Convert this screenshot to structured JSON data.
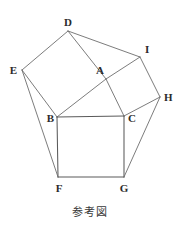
{
  "figure": {
    "caption": "参考図",
    "stroke_color": "#6d6d6d",
    "label_color": "#2b2b2b",
    "background_color": "#ffffff",
    "width": 180,
    "height": 231,
    "points": {
      "A": {
        "label": "A",
        "x": 106,
        "y": 79,
        "label_x": 104,
        "label_y": 74
      },
      "B": {
        "label": "B",
        "x": 57,
        "y": 117,
        "label_x": 49,
        "label_y": 121
      },
      "C": {
        "label": "C",
        "x": 124,
        "y": 116,
        "label_x": 128,
        "label_y": 121
      },
      "D": {
        "label": "D",
        "x": 68,
        "y": 31,
        "label_x": 66,
        "label_y": 26
      },
      "E": {
        "label": "E",
        "x": 22,
        "y": 70,
        "label_x": 13,
        "label_y": 73
      },
      "F": {
        "label": "F",
        "x": 58,
        "y": 177,
        "label_x": 56,
        "label_y": 191
      },
      "G": {
        "label": "G",
        "x": 124,
        "y": 177,
        "label_x": 121,
        "label_y": 191
      },
      "H": {
        "label": "H",
        "x": 160,
        "y": 97,
        "label_x": 164,
        "label_y": 101
      },
      "I": {
        "label": "I",
        "x": 140,
        "y": 57,
        "label_x": 145,
        "label_y": 53
      }
    },
    "segments": [
      {
        "name": "segment-AB",
        "from": "A",
        "to": "B"
      },
      {
        "name": "segment-BC",
        "from": "B",
        "to": "C"
      },
      {
        "name": "segment-CA",
        "from": "C",
        "to": "A"
      },
      {
        "name": "segment-BE",
        "from": "B",
        "to": "E"
      },
      {
        "name": "segment-ED",
        "from": "E",
        "to": "D"
      },
      {
        "name": "segment-DA",
        "from": "D",
        "to": "A"
      },
      {
        "name": "segment-AI",
        "from": "A",
        "to": "I"
      },
      {
        "name": "segment-IH",
        "from": "I",
        "to": "H"
      },
      {
        "name": "segment-HC",
        "from": "H",
        "to": "C"
      },
      {
        "name": "segment-BF",
        "from": "B",
        "to": "F"
      },
      {
        "name": "segment-FG",
        "from": "F",
        "to": "G"
      },
      {
        "name": "segment-GC",
        "from": "G",
        "to": "C"
      },
      {
        "name": "segment-DI",
        "from": "D",
        "to": "I"
      },
      {
        "name": "segment-EF",
        "from": "E",
        "to": "F"
      },
      {
        "name": "segment-HG",
        "from": "H",
        "to": "G"
      }
    ],
    "squares": [
      {
        "name": "square-on-AB",
        "vertices": [
          "A",
          "D",
          "E",
          "B"
        ]
      },
      {
        "name": "square-on-AC",
        "vertices": [
          "A",
          "I",
          "H",
          "C"
        ]
      },
      {
        "name": "square-on-BC",
        "vertices": [
          "B",
          "F",
          "G",
          "C"
        ]
      }
    ],
    "triangle": {
      "name": "triangle-ABC",
      "vertices": [
        "A",
        "B",
        "C"
      ]
    }
  }
}
